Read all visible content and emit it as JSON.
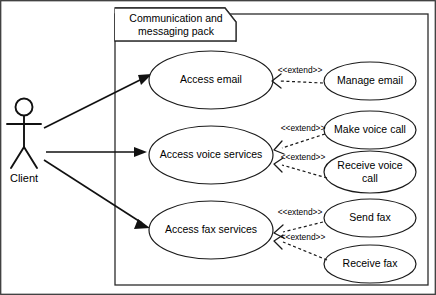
{
  "diagram": {
    "type": "uml-use-case-diagram",
    "background_color": "#ffffff",
    "line_color": "#1a1a1a"
  },
  "package": {
    "name_line1": "Communication and",
    "name_line2": "messaging pack"
  },
  "actor": {
    "label": "Client"
  },
  "use_cases": [
    {
      "id": "access-email",
      "label": "Access email"
    },
    {
      "id": "access-voice-services",
      "label": "Access voice services"
    },
    {
      "id": "access-fax-services",
      "label": "Access fax services"
    }
  ],
  "extending_use_cases": [
    {
      "id": "manage-email",
      "label_line1": "Manage email",
      "label_line2": ""
    },
    {
      "id": "make-voice-call",
      "label_line1": "Make voice call",
      "label_line2": ""
    },
    {
      "id": "receive-voice-call",
      "label_line1": "Receive voice",
      "label_line2": "call"
    },
    {
      "id": "send-fax",
      "label_line1": "Send fax",
      "label_line2": ""
    },
    {
      "id": "receive-fax",
      "label_line1": "Receive fax",
      "label_line2": ""
    }
  ],
  "relationships": {
    "extend_stereotype": "<<extend>>",
    "extends": [
      {
        "from": "manage-email",
        "to": "access-email",
        "label": "<<extend>>"
      },
      {
        "from": "make-voice-call",
        "to": "access-voice-services",
        "label": "<<extend>>"
      },
      {
        "from": "receive-voice-call",
        "to": "access-voice-services",
        "label": "<<extend>>"
      },
      {
        "from": "send-fax",
        "to": "access-fax-services",
        "label": "<<extend>>"
      },
      {
        "from": "receive-fax",
        "to": "access-fax-services",
        "label": "<<extend>>"
      }
    ],
    "associations": [
      {
        "from": "actor-client",
        "to": "access-email"
      },
      {
        "from": "actor-client",
        "to": "access-voice-services"
      },
      {
        "from": "actor-client",
        "to": "access-fax-services"
      }
    ]
  }
}
